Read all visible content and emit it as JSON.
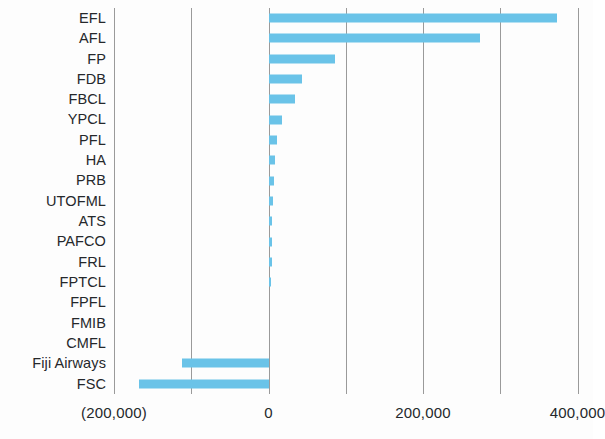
{
  "chart_data": {
    "type": "bar",
    "orientation": "horizontal",
    "title": "",
    "xlabel": "",
    "ylabel": "",
    "categories": [
      "EFL",
      "AFL",
      "FP",
      "FDB",
      "FBCL",
      "YPCL",
      "PFL",
      "HA",
      "PRB",
      "UTOFML",
      "ATS",
      "PAFCO",
      "FRL",
      "FPTCL",
      "FPFL",
      "FMIB",
      "CMFL",
      "Fiji Airways",
      "FSC"
    ],
    "values": [
      373000,
      274000,
      86000,
      43000,
      34000,
      18000,
      11000,
      9000,
      7000,
      6000,
      5000,
      5000,
      4000,
      3000,
      0,
      0,
      0,
      -112000,
      -167000
    ],
    "xlim": [
      -200000,
      420000
    ],
    "xticks": [
      -200000,
      0,
      200000,
      400000
    ],
    "xtick_labels": [
      "(200,000)",
      "0",
      "200,000",
      "400,000"
    ],
    "gridline_values": [
      -200000,
      -100000,
      0,
      100000,
      200000,
      300000,
      400000
    ],
    "grid": true,
    "legend": false,
    "bar_color": "#6ac3e8",
    "gridline_color": "#9a9a9a",
    "background_color": "#fdfdfd",
    "text_color": "#25282b"
  }
}
